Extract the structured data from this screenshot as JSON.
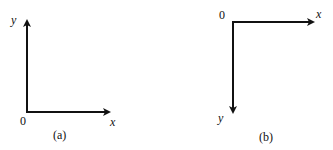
{
  "diagrams": [
    {
      "caption": "(a)",
      "origin_label": "0",
      "x_label": "x",
      "y_label": "y",
      "x_direction": "right",
      "y_direction": "up"
    },
    {
      "caption": "(b)",
      "origin_label": "0",
      "x_label": "x",
      "y_label": "y",
      "x_direction": "right",
      "y_direction": "down"
    }
  ],
  "colors": {
    "axis": "#111111",
    "background": "#ffffff"
  }
}
